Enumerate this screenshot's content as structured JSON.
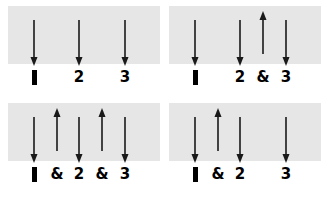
{
  "figure": {
    "panel_background": "#e6e6e6",
    "arrow_color": "#1a1a1a",
    "text_color": "#000000",
    "panel_count": 4
  },
  "glyphs": {
    "beat_bar": "▌",
    "ampersand": "&",
    "two": "2",
    "three": "3"
  },
  "panels": [
    {
      "id": "panel-top-left",
      "position": "top-left",
      "labels": [
        {
          "text": "▌",
          "kind": "bar",
          "x": 26
        },
        {
          "text": "2",
          "kind": "numeral",
          "x": 71
        },
        {
          "text": "3",
          "kind": "numeral",
          "x": 117
        }
      ],
      "arrows": [
        {
          "direction": "down",
          "x": 26
        },
        {
          "direction": "down",
          "x": 71
        },
        {
          "direction": "down",
          "x": 117
        }
      ]
    },
    {
      "id": "panel-top-right",
      "position": "top-right",
      "labels": [
        {
          "text": "▌",
          "kind": "bar",
          "x": 26
        },
        {
          "text": "2",
          "kind": "numeral",
          "x": 71
        },
        {
          "text": "&",
          "kind": "ampersand",
          "x": 94
        },
        {
          "text": "3",
          "kind": "numeral",
          "x": 117
        }
      ],
      "arrows": [
        {
          "direction": "down",
          "x": 26
        },
        {
          "direction": "down",
          "x": 71
        },
        {
          "direction": "up",
          "x": 94
        },
        {
          "direction": "down",
          "x": 117
        }
      ]
    },
    {
      "id": "panel-bottom-left",
      "position": "bottom-left",
      "labels": [
        {
          "text": "▌",
          "kind": "bar",
          "x": 26
        },
        {
          "text": "&",
          "kind": "ampersand",
          "x": 49
        },
        {
          "text": "2",
          "kind": "numeral",
          "x": 71
        },
        {
          "text": "&",
          "kind": "ampersand",
          "x": 94
        },
        {
          "text": "3",
          "kind": "numeral",
          "x": 117
        }
      ],
      "arrows": [
        {
          "direction": "down",
          "x": 26
        },
        {
          "direction": "up",
          "x": 49
        },
        {
          "direction": "down",
          "x": 71
        },
        {
          "direction": "up",
          "x": 94
        },
        {
          "direction": "down",
          "x": 117
        }
      ]
    },
    {
      "id": "panel-bottom-right",
      "position": "bottom-right",
      "labels": [
        {
          "text": "▌",
          "kind": "bar",
          "x": 26
        },
        {
          "text": "&",
          "kind": "ampersand",
          "x": 49
        },
        {
          "text": "2",
          "kind": "numeral",
          "x": 71
        },
        {
          "text": "3",
          "kind": "numeral",
          "x": 117
        }
      ],
      "arrows": [
        {
          "direction": "down",
          "x": 26
        },
        {
          "direction": "up",
          "x": 49
        },
        {
          "direction": "down",
          "x": 71
        },
        {
          "direction": "down",
          "x": 117
        }
      ]
    }
  ]
}
